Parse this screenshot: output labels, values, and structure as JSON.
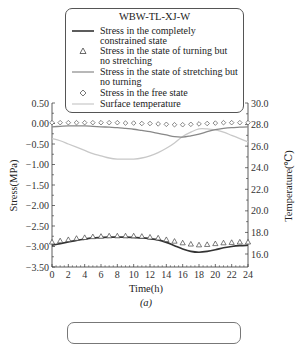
{
  "chart_data": {
    "type": "line",
    "title": "WBW-TL-XJ-W",
    "caption": "(a)",
    "xlabel": "Time(h)",
    "ylabel": "Stress(MPa)",
    "y2label": "Temperature(℃)",
    "xlim": [
      0,
      24
    ],
    "ylim": [
      -3.5,
      0.5
    ],
    "y2lim": [
      16.0,
      30.0
    ],
    "x_ticks": [
      "0",
      "2",
      "4",
      "6",
      "8",
      "10",
      "12",
      "14",
      "16",
      "18",
      "20",
      "22",
      "24"
    ],
    "y_ticks": [
      "0.50",
      "0.00",
      "-0.50",
      "-1.00",
      "-1.50",
      "-2.00",
      "-2.50",
      "-3.00",
      "-3.50"
    ],
    "y2_ticks": [
      "30.0",
      "28.0",
      "26.0",
      "24.0",
      "22.0",
      "20.0",
      "18.0",
      "16.0"
    ],
    "grid": false,
    "legend_position": "top, inside rounded box",
    "legend": [
      {
        "label": "Stress in the completely constrained state",
        "marker": "solid-dark-line"
      },
      {
        "label": "Stress in the state of turning but no stretching",
        "marker": "triangle"
      },
      {
        "label": "Stress in the state of stretching but no turning",
        "marker": "solid-gray-line"
      },
      {
        "label": "Stress in the free state",
        "marker": "diamond"
      },
      {
        "label": "Surface temperature",
        "marker": "light-gray-line"
      }
    ],
    "x": [
      0,
      1,
      2,
      3,
      4,
      5,
      6,
      7,
      8,
      9,
      10,
      11,
      12,
      13,
      14,
      15,
      16,
      17,
      18,
      19,
      20,
      21,
      22,
      23,
      24
    ],
    "series": [
      {
        "name": "Stress in the completely constrained state",
        "axis": "left",
        "values": [
          -2.97,
          -2.93,
          -2.89,
          -2.85,
          -2.82,
          -2.79,
          -2.78,
          -2.77,
          -2.77,
          -2.77,
          -2.78,
          -2.79,
          -2.81,
          -2.84,
          -2.9,
          -2.98,
          -3.06,
          -3.12,
          -3.14,
          -3.12,
          -3.08,
          -3.03,
          -3.0,
          -2.98,
          -2.97
        ]
      },
      {
        "name": "Stress in the state of turning but no stretching",
        "axis": "left",
        "values": [
          -2.9,
          -2.87,
          -2.84,
          -2.81,
          -2.79,
          -2.77,
          -2.76,
          -2.75,
          -2.75,
          -2.75,
          -2.75,
          -2.76,
          -2.78,
          -2.8,
          -2.84,
          -2.88,
          -2.92,
          -2.95,
          -2.97,
          -2.96,
          -2.94,
          -2.92,
          -2.91,
          -2.9,
          -2.9
        ]
      },
      {
        "name": "Stress in the state of stretching but no turning",
        "axis": "left",
        "values": [
          -0.08,
          -0.07,
          -0.06,
          -0.06,
          -0.06,
          -0.07,
          -0.08,
          -0.09,
          -0.1,
          -0.12,
          -0.14,
          -0.17,
          -0.2,
          -0.24,
          -0.28,
          -0.32,
          -0.33,
          -0.3,
          -0.26,
          -0.2,
          -0.15,
          -0.12,
          -0.1,
          -0.09,
          -0.08
        ]
      },
      {
        "name": "Stress in the free state",
        "axis": "left",
        "values": [
          0.02,
          0.02,
          0.02,
          0.02,
          0.02,
          0.02,
          0.02,
          0.02,
          0.02,
          0.01,
          0.01,
          0.0,
          0.0,
          -0.01,
          -0.02,
          -0.03,
          -0.03,
          -0.02,
          -0.01,
          0.0,
          0.01,
          0.02,
          0.02,
          0.02,
          0.02
        ]
      },
      {
        "name": "Surface temperature",
        "axis": "right",
        "values": [
          26.7,
          26.5,
          26.2,
          25.9,
          25.6,
          25.3,
          25.1,
          24.9,
          24.8,
          24.8,
          24.8,
          24.9,
          25.1,
          25.4,
          25.8,
          26.3,
          26.9,
          27.3,
          27.6,
          27.6,
          27.5,
          27.3,
          27.0,
          26.7,
          26.4
        ]
      }
    ]
  },
  "legend": {
    "title": "WBW-TL-XJ-W",
    "items": [
      {
        "line1": "Stress in the completely",
        "line2": "constrained state"
      },
      {
        "line1": "Stress in the state of turning but",
        "line2": "no stretching"
      },
      {
        "line1": "Stress in the state of stretching but",
        "line2": "no turning"
      },
      {
        "line1": "Stress in the free state"
      },
      {
        "line1": "Surface temperature"
      }
    ]
  },
  "axes": {
    "xlabel": "Time(h)",
    "ylabel": "Stress(MPa)",
    "y2label": "Temperature(℃)",
    "caption": "(a)"
  },
  "colors": {
    "constrained": "#333333",
    "turning": "#444444",
    "stretching": "#888888",
    "free": "#555555",
    "surface_temp": "#c8c8c8",
    "axis": "#333333"
  }
}
